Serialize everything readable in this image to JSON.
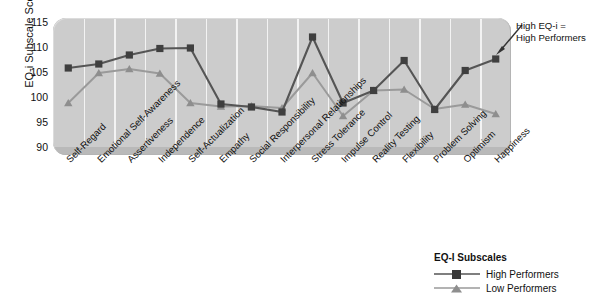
{
  "chart_data": {
    "type": "line",
    "title": "",
    "xlabel": "",
    "ylabel": "EQ-i Subscale Scores",
    "ylim": [
      90,
      115
    ],
    "yticks": [
      115,
      110,
      105,
      100,
      95,
      90
    ],
    "grid": "vertical-white",
    "legend_position": "bottom-right",
    "categories": [
      "Self-Regard",
      "Emotional Self-Awareness",
      "Assertiveness",
      "Independence",
      "Self-Actualization",
      "Empathy",
      "Social Responsibility",
      "Interpersonal Relationships",
      "Stress Tolerance",
      "Impulse Control",
      "Reality Testing",
      "Flexibility",
      "Problem Solving",
      "Optimism",
      "Happiness"
    ],
    "series": [
      {
        "name": "High Performers",
        "marker": "square",
        "color": "#555555",
        "values": [
          105.8,
          106.6,
          108.4,
          109.7,
          109.8,
          98.6,
          98.0,
          97.0,
          112.0,
          98.8,
          101.3,
          107.3,
          97.5,
          105.3,
          107.6
        ]
      },
      {
        "name": "Low Performers",
        "marker": "triangle",
        "color": "#9a9a9a",
        "values": [
          98.8,
          104.8,
          105.6,
          104.7,
          98.8,
          98.1,
          98.2,
          97.8,
          104.8,
          96.2,
          101.3,
          101.5,
          97.6,
          98.5,
          96.6
        ]
      }
    ],
    "annotations": [
      {
        "text_line1": "High EQ-i =",
        "text_line2": "High Performers",
        "points_to": "High Performers"
      }
    ]
  },
  "legend": {
    "title": "EQ-I Subscales",
    "entries": [
      {
        "label": "High Performers"
      },
      {
        "label": "Low Performers"
      }
    ]
  },
  "axis": {
    "y_title": "EQ-i Subscale Scores"
  }
}
